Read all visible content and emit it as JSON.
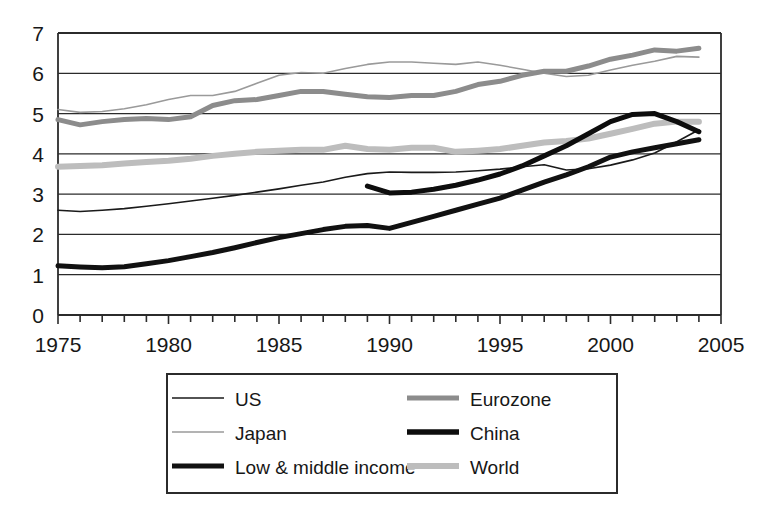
{
  "chart_data": {
    "type": "line",
    "title": "",
    "subtitle": "",
    "xlabel": "",
    "ylabel": "",
    "xlim": [
      1975,
      2005
    ],
    "ylim": [
      0,
      7
    ],
    "x_tick_labels": [
      "1975",
      "1980",
      "1985",
      "1990",
      "1995",
      "2000",
      "2005"
    ],
    "x_tick_values": [
      1975,
      1980,
      1985,
      1990,
      1995,
      2000,
      2005
    ],
    "x_minor_tick_step": 1,
    "y_tick_labels": [
      "0",
      "1",
      "2",
      "3",
      "4",
      "5",
      "6",
      "7"
    ],
    "y_tick_values": [
      0,
      1,
      2,
      3,
      4,
      5,
      6,
      7
    ],
    "grid": "horizontal",
    "legend_position": "bottom",
    "series": [
      {
        "name": "US",
        "color": "#1a1a1a",
        "width": 1.6,
        "x": [
          1975,
          1976,
          1977,
          1978,
          1979,
          1980,
          1981,
          1982,
          1983,
          1984,
          1985,
          1986,
          1987,
          1988,
          1989,
          1990,
          1991,
          1992,
          1993,
          1994,
          1995,
          1996,
          1997,
          1998,
          1999,
          2000,
          2001,
          2002,
          2003,
          2004
        ],
        "values": [
          2.6,
          2.57,
          2.6,
          2.64,
          2.7,
          2.76,
          2.83,
          2.9,
          2.97,
          3.05,
          3.13,
          3.22,
          3.3,
          3.42,
          3.51,
          3.55,
          3.54,
          3.54,
          3.55,
          3.58,
          3.62,
          3.68,
          3.73,
          3.6,
          3.63,
          3.72,
          3.85,
          4.02,
          4.3,
          4.6
        ]
      },
      {
        "name": "Japan",
        "color": "#9a9a9a",
        "width": 1.6,
        "x": [
          1975,
          1976,
          1977,
          1978,
          1979,
          1980,
          1981,
          1982,
          1983,
          1984,
          1985,
          1986,
          1987,
          1988,
          1989,
          1990,
          1991,
          1992,
          1993,
          1994,
          1995,
          1996,
          1997,
          1998,
          1999,
          2000,
          2001,
          2002,
          2003,
          2004
        ],
        "values": [
          5.1,
          5.03,
          5.05,
          5.12,
          5.22,
          5.35,
          5.45,
          5.45,
          5.55,
          5.75,
          5.95,
          6.02,
          6.0,
          6.12,
          6.22,
          6.28,
          6.28,
          6.25,
          6.22,
          6.28,
          6.2,
          6.1,
          6.0,
          5.92,
          5.95,
          6.08,
          6.2,
          6.3,
          6.42,
          6.4
        ]
      },
      {
        "name": "Low & middle income",
        "color": "#111111",
        "width": 5.0,
        "x": [
          1975,
          1976,
          1977,
          1978,
          1979,
          1980,
          1981,
          1982,
          1983,
          1984,
          1985,
          1986,
          1987,
          1988,
          1989,
          1990,
          1991,
          1992,
          1993,
          1994,
          1995,
          1996,
          1997,
          1998,
          1999,
          2000,
          2001,
          2002,
          2003,
          2004
        ],
        "values": [
          1.22,
          1.19,
          1.17,
          1.2,
          1.27,
          1.35,
          1.45,
          1.55,
          1.67,
          1.8,
          1.92,
          2.02,
          2.12,
          2.2,
          2.22,
          2.15,
          2.3,
          2.45,
          2.6,
          2.75,
          2.9,
          3.1,
          3.3,
          3.48,
          3.68,
          3.92,
          4.05,
          4.15,
          4.25,
          4.35
        ]
      },
      {
        "name": "Eurozone",
        "color": "#8c8c8c",
        "width": 5.0,
        "x": [
          1975,
          1976,
          1977,
          1978,
          1979,
          1980,
          1981,
          1982,
          1983,
          1984,
          1985,
          1986,
          1987,
          1988,
          1989,
          1990,
          1991,
          1992,
          1993,
          1994,
          1995,
          1996,
          1997,
          1998,
          1999,
          2000,
          2001,
          2002,
          2003,
          2004
        ],
        "values": [
          4.85,
          4.72,
          4.8,
          4.85,
          4.88,
          4.85,
          4.92,
          5.2,
          5.32,
          5.35,
          5.45,
          5.55,
          5.55,
          5.48,
          5.42,
          5.4,
          5.45,
          5.45,
          5.55,
          5.72,
          5.8,
          5.95,
          6.05,
          6.05,
          6.18,
          6.35,
          6.45,
          6.58,
          6.55,
          6.62
        ]
      },
      {
        "name": "China",
        "color": "#0d0d0d",
        "width": 5.0,
        "x": [
          1989,
          1990,
          1991,
          1992,
          1993,
          1994,
          1995,
          1996,
          1997,
          1998,
          1999,
          2000,
          2001,
          2002,
          2003,
          2004
        ],
        "values": [
          3.2,
          3.03,
          3.05,
          3.12,
          3.22,
          3.35,
          3.5,
          3.7,
          3.95,
          4.2,
          4.5,
          4.8,
          4.98,
          5.0,
          4.8,
          4.55
        ]
      },
      {
        "name": "World",
        "color": "#bdbdbd",
        "width": 6.0,
        "x": [
          1975,
          1976,
          1977,
          1978,
          1979,
          1980,
          1981,
          1982,
          1983,
          1984,
          1985,
          1986,
          1987,
          1988,
          1989,
          1990,
          1991,
          1992,
          1993,
          1994,
          1995,
          1996,
          1997,
          1998,
          1999,
          2000,
          2001,
          2002,
          2003,
          2004
        ],
        "values": [
          3.68,
          3.7,
          3.72,
          3.76,
          3.8,
          3.83,
          3.88,
          3.95,
          4.0,
          4.05,
          4.08,
          4.1,
          4.1,
          4.2,
          4.12,
          4.1,
          4.15,
          4.15,
          4.05,
          4.08,
          4.12,
          4.2,
          4.28,
          4.32,
          4.38,
          4.5,
          4.62,
          4.75,
          4.8,
          4.8
        ]
      }
    ]
  },
  "legend": {
    "entries": [
      {
        "label": "US",
        "key": "us"
      },
      {
        "label": "Eurozone",
        "key": "eurozone"
      },
      {
        "label": "Japan",
        "key": "japan"
      },
      {
        "label": "China",
        "key": "china"
      },
      {
        "label": "Low & middle income",
        "key": "low-middle-income"
      },
      {
        "label": "World",
        "key": "world"
      }
    ]
  },
  "colors": {
    "us": "#1a1a1a",
    "japan": "#9a9a9a",
    "low_middle_income": "#111111",
    "eurozone": "#8c8c8c",
    "china": "#0d0d0d",
    "world": "#bdbdbd",
    "axis": "#2b2b2b",
    "background": "#ffffff"
  }
}
